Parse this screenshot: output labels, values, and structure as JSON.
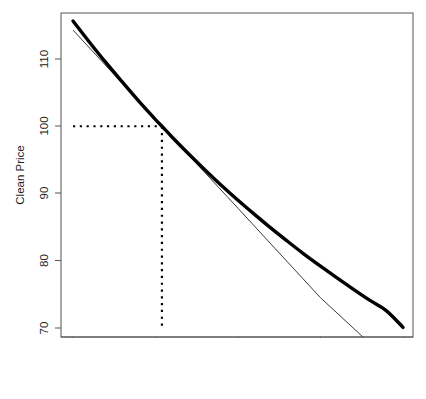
{
  "chart_data": {
    "type": "line",
    "title": "",
    "xlabel": "Yield to Maturity (%)",
    "ylabel": "Clean Price",
    "xlim": [
      0,
      20
    ],
    "ylim": [
      68.6,
      116.2
    ],
    "xticks": [
      0,
      5,
      10,
      15,
      20
    ],
    "xtick_labels": [
      "0",
      "5",
      "10",
      "15",
      "20"
    ],
    "yticks": [
      70,
      80,
      90,
      100,
      110
    ],
    "ytick_labels": [
      "70",
      "80",
      "90",
      "100",
      "110"
    ],
    "grid": false,
    "legend": "none",
    "series": [
      {
        "name": "price-yield-curve",
        "style": "solid-thick",
        "color": "#000000",
        "x": [
          0,
          1,
          2,
          3,
          4,
          5,
          5.39,
          6,
          7,
          8,
          9,
          10,
          11,
          12,
          13,
          14,
          15,
          16,
          17,
          18,
          19,
          20
        ],
        "y": [
          115.65,
          112.5,
          109.45,
          106.55,
          103.7,
          101.0,
          100.0,
          98.4,
          95.9,
          93.5,
          91.2,
          89.0,
          86.9,
          84.85,
          82.9,
          81.0,
          79.2,
          77.45,
          75.75,
          74.1,
          72.55,
          70.1
        ]
      },
      {
        "name": "tangent-line-at-par",
        "style": "solid-thin",
        "color": "#3a3a3a",
        "x": [
          0,
          5.39,
          10,
          15,
          17.6
        ],
        "y": [
          114.3,
          100.0,
          87.8,
          74.5,
          68.6
        ]
      }
    ],
    "annotations": [
      {
        "name": "par-price-guide",
        "style": "dotted",
        "orientation": "horizontal",
        "value": 100,
        "from_x": 0,
        "to_x": 5.39
      },
      {
        "name": "par-yield-guide",
        "style": "dotted",
        "orientation": "vertical",
        "value": 5.39,
        "from_y": 70,
        "to_y": 100
      }
    ]
  },
  "axes": {
    "x_title": "Yield to Maturity (%)",
    "y_title": "Clean Price",
    "x_tick_labels": [
      "0",
      "5",
      "10",
      "15",
      "20"
    ],
    "y_tick_labels": [
      "70",
      "80",
      "90",
      "100",
      "110"
    ]
  },
  "colors": {
    "curve": "#000000",
    "tangent": "#3a3a3a",
    "frame": "#555555",
    "background": "#ffffff",
    "text": "#222222"
  }
}
